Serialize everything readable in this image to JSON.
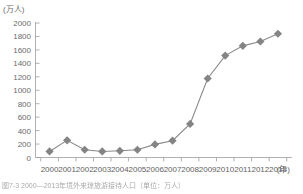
{
  "figure": {
    "unit_label": "(万人)",
    "caption": "图7-3   2000—2013年境外来琼旅游接待人口（单位：万人）",
    "x_axis_suffix": "(年)"
  },
  "style": {
    "marker_color": "#848484",
    "line_color": "#8a8a8a",
    "axis_color": "#9d9d9d",
    "text_color": "#6b6b6b",
    "background": "#ffffff"
  },
  "chart_data": {
    "type": "line",
    "title": "",
    "xlabel": "(年)",
    "ylabel": "(万人)",
    "categories": [
      "2000",
      "2001",
      "2002",
      "2003",
      "2004",
      "2005",
      "2006",
      "2007",
      "2008",
      "2009",
      "2010",
      "2011",
      "2012",
      "2013"
    ],
    "values": [
      90,
      255,
      115,
      90,
      100,
      115,
      195,
      250,
      500,
      1175,
      1515,
      1660,
      1725,
      1840
    ],
    "ytick_labels": [
      "0",
      "200",
      "400",
      "600",
      "800",
      "1000",
      "1200",
      "1400",
      "1600",
      "1800",
      "2000"
    ],
    "ytick_values": [
      0,
      200,
      400,
      600,
      800,
      1000,
      1200,
      1400,
      1600,
      1800,
      2000
    ],
    "ylim": [
      0,
      2000
    ],
    "grid": false,
    "legend": "none",
    "marker": "diamond",
    "series": [
      {
        "name": "境外来琼旅游接待人口",
        "values": [
          90,
          255,
          115,
          90,
          100,
          115,
          195,
          250,
          500,
          1175,
          1515,
          1660,
          1725,
          1840
        ]
      }
    ]
  }
}
